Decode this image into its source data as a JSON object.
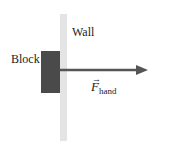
{
  "diagram": {
    "wall": {
      "label": "Wall",
      "color": "#e4e4e4"
    },
    "block": {
      "label": "Block",
      "color": "#4a4a4a"
    },
    "force": {
      "symbol": "F",
      "subscript": "hand",
      "vector_mark": "→",
      "direction": "right",
      "color": "#555555"
    }
  }
}
